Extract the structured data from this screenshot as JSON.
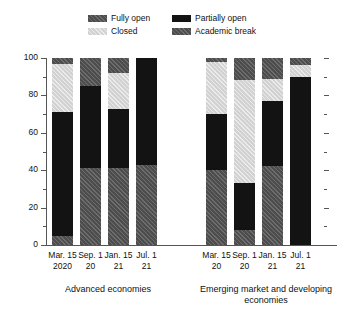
{
  "legend": {
    "items": [
      {
        "label": "Fully open",
        "key": "fully-open",
        "color": "#4d4d4d"
      },
      {
        "label": "Partially open",
        "key": "partially-open",
        "color": "#131313"
      },
      {
        "label": "Closed",
        "key": "closed",
        "color": "#d2d2d2"
      },
      {
        "label": "Academic break",
        "key": "academic-break",
        "color": "#4d4d4d"
      }
    ]
  },
  "axis": {
    "y_ticks": [
      "0",
      "20",
      "40",
      "60",
      "80",
      "100"
    ],
    "y_minor": [
      "10",
      "30",
      "50",
      "70",
      "90"
    ]
  },
  "groups": [
    {
      "label": "Advanced economies"
    },
    {
      "label": "Emerging market and developing economies"
    }
  ],
  "chart_data": {
    "type": "bar",
    "title": "",
    "subtitle": "",
    "xlabel": "",
    "ylabel": "",
    "ylim": [
      0,
      100
    ],
    "stacked": true,
    "stack_percent": true,
    "grid": false,
    "legend_position": "top-center",
    "stack_order_bottom_to_top": [
      "Academic break",
      "Partially open",
      "Closed",
      "Fully open"
    ],
    "groups": [
      "Advanced economies",
      "Emerging market and developing economies"
    ],
    "categories": [
      {
        "line1": "Mar. 15",
        "line2": "2020",
        "group": "Advanced economies"
      },
      {
        "line1": "Sep. 1",
        "line2": "20",
        "group": "Advanced economies"
      },
      {
        "line1": "Jan. 15",
        "line2": "21",
        "group": "Advanced economies"
      },
      {
        "line1": "Jul. 1",
        "line2": "21",
        "group": "Advanced economies"
      },
      {
        "line1": "Mar. 15",
        "line2": "20",
        "group": "Emerging market and developing economies"
      },
      {
        "line1": "Sep. 1",
        "line2": "20",
        "group": "Emerging market and developing economies"
      },
      {
        "line1": "Jan. 15",
        "line2": "21",
        "group": "Emerging market and developing economies"
      },
      {
        "line1": "Jul. 1",
        "line2": "21",
        "group": "Emerging market and developing economies"
      }
    ],
    "series": [
      {
        "name": "Academic break",
        "key": "academic-break",
        "values": [
          5,
          41,
          41,
          43,
          40,
          8,
          42,
          0
        ]
      },
      {
        "name": "Partially open",
        "key": "partially-open",
        "values": [
          66,
          44,
          32,
          57,
          30,
          25,
          35,
          90
        ]
      },
      {
        "name": "Closed",
        "key": "closed",
        "values": [
          26,
          0,
          19,
          0,
          28,
          55,
          12,
          6
        ]
      },
      {
        "name": "Fully open",
        "key": "fully-open",
        "values": [
          3,
          15,
          8,
          0,
          2,
          12,
          11,
          4
        ]
      }
    ],
    "bars": [
      {
        "label": "Mar. 15 2020",
        "group": 0,
        "segments": [
          {
            "key": "academic-break",
            "value": 5
          },
          {
            "key": "partially-open",
            "value": 66
          },
          {
            "key": "closed",
            "value": 26
          },
          {
            "key": "fully-open",
            "value": 3
          }
        ]
      },
      {
        "label": "Sep. 1 20",
        "group": 0,
        "segments": [
          {
            "key": "academic-break",
            "value": 41
          },
          {
            "key": "partially-open",
            "value": 44
          },
          {
            "key": "closed",
            "value": 0
          },
          {
            "key": "fully-open",
            "value": 15
          }
        ]
      },
      {
        "label": "Jan. 15 21",
        "group": 0,
        "segments": [
          {
            "key": "academic-break",
            "value": 41
          },
          {
            "key": "partially-open",
            "value": 32
          },
          {
            "key": "closed",
            "value": 19
          },
          {
            "key": "fully-open",
            "value": 8
          }
        ]
      },
      {
        "label": "Jul. 1 21",
        "group": 0,
        "segments": [
          {
            "key": "academic-break",
            "value": 43
          },
          {
            "key": "partially-open",
            "value": 57
          },
          {
            "key": "closed",
            "value": 0
          },
          {
            "key": "fully-open",
            "value": 0
          }
        ]
      },
      {
        "label": "Mar. 15 20",
        "group": 1,
        "segments": [
          {
            "key": "academic-break",
            "value": 40
          },
          {
            "key": "partially-open",
            "value": 30
          },
          {
            "key": "closed",
            "value": 28
          },
          {
            "key": "fully-open",
            "value": 2
          }
        ]
      },
      {
        "label": "Sep. 1 20",
        "group": 1,
        "segments": [
          {
            "key": "academic-break",
            "value": 8
          },
          {
            "key": "partially-open",
            "value": 25
          },
          {
            "key": "closed",
            "value": 55
          },
          {
            "key": "fully-open",
            "value": 12
          }
        ]
      },
      {
        "label": "Jan. 15 21",
        "group": 1,
        "segments": [
          {
            "key": "academic-break",
            "value": 42
          },
          {
            "key": "partially-open",
            "value": 35
          },
          {
            "key": "closed",
            "value": 12
          },
          {
            "key": "fully-open",
            "value": 11
          }
        ]
      },
      {
        "label": "Jul. 1 21",
        "group": 1,
        "segments": [
          {
            "key": "academic-break",
            "value": 0
          },
          {
            "key": "partially-open",
            "value": 90
          },
          {
            "key": "closed",
            "value": 6
          },
          {
            "key": "fully-open",
            "value": 4
          }
        ]
      }
    ]
  }
}
